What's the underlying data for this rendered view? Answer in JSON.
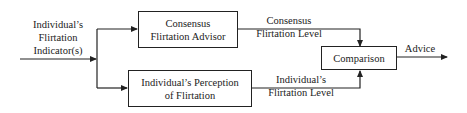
{
  "diagram": {
    "input": {
      "lines": [
        "Individual’s",
        "Flirtation",
        "Indicator(s)"
      ]
    },
    "boxes": {
      "consensus_advisor": {
        "lines": [
          "Consensus",
          "Flirtation Advisor"
        ]
      },
      "individual_perception": {
        "lines": [
          "Individual’s Perception",
          "of Flirtation"
        ]
      },
      "comparison": {
        "lines": [
          "Comparison"
        ]
      }
    },
    "edge_labels": {
      "consensus_level": {
        "lines": [
          "Consensus",
          "Flirtation Level"
        ]
      },
      "individual_level": {
        "lines": [
          "Individual’s",
          "Flirtation Level"
        ]
      },
      "output": {
        "lines": [
          "Advice"
        ]
      }
    },
    "colors": {
      "stroke": "#222222",
      "background": "#ffffff"
    }
  }
}
